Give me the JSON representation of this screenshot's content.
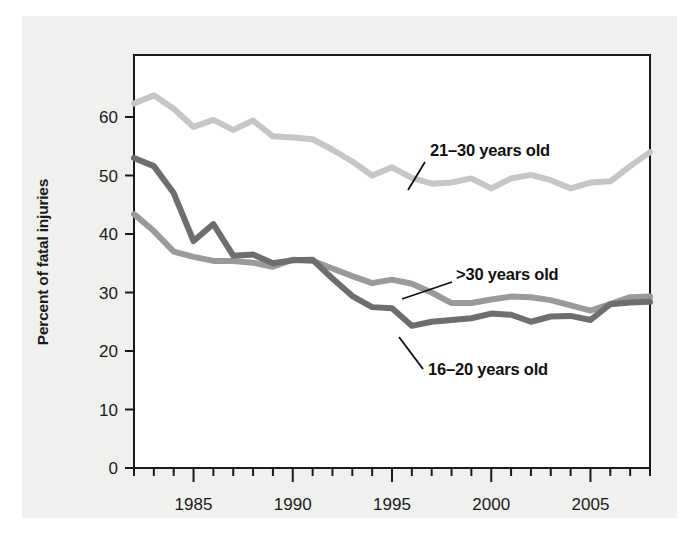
{
  "chart_data": {
    "type": "line",
    "title": "",
    "subtitle": "",
    "xlabel": "",
    "ylabel": "Percent of fatal injuries",
    "xlim": [
      1982,
      2008
    ],
    "ylim": [
      0,
      66
    ],
    "ytick_values": [
      0,
      10,
      20,
      30,
      40,
      50,
      60
    ],
    "ytick_labels": [
      "0",
      "10",
      "20",
      "30",
      "40",
      "50",
      "60"
    ],
    "xtick_labels": [
      "1985",
      "1990",
      "1995",
      "2000",
      "2005"
    ],
    "xtick_major_values": [
      1985,
      1990,
      1995,
      2000,
      2005
    ],
    "xtick_minor_step": 1,
    "grid": false,
    "legend_position": "inline-annotations",
    "x": [
      1982,
      1983,
      1984,
      1985,
      1986,
      1987,
      1988,
      1989,
      1990,
      1991,
      1992,
      1993,
      1994,
      1995,
      1996,
      1997,
      1998,
      1999,
      2000,
      2001,
      2002,
      2003,
      2004,
      2005,
      2006,
      2007,
      2008
    ],
    "series": [
      {
        "name": "21–30 years old",
        "color": "#c6c6c6",
        "values": [
          62.3,
          63.7,
          61.4,
          58.3,
          59.5,
          57.8,
          59.4,
          56.7,
          56.5,
          56.2,
          54.4,
          52.4,
          50.0,
          51.4,
          49.6,
          48.6,
          48.8,
          49.5,
          47.8,
          49.5,
          50.1,
          49.2,
          47.8,
          48.8,
          49.0,
          51.6,
          54.0
        ]
      },
      {
        "name": ">30 years old",
        "color": "#9a9a9a",
        "values": [
          43.4,
          40.5,
          37.0,
          36.1,
          35.4,
          35.4,
          35.1,
          34.4,
          35.6,
          35.4,
          34.1,
          32.8,
          31.6,
          32.2,
          31.5,
          30.0,
          28.2,
          28.2,
          28.8,
          29.3,
          29.2,
          28.7,
          27.8,
          26.9,
          28.0,
          29.2,
          29.3
        ]
      },
      {
        "name": "16–20 years old",
        "color": "#6e6e6e",
        "values": [
          53.0,
          51.6,
          47.0,
          38.8,
          41.7,
          36.3,
          36.5,
          35.0,
          35.5,
          35.6,
          32.4,
          29.4,
          27.5,
          27.3,
          24.3,
          25.0,
          25.3,
          25.6,
          26.4,
          26.2,
          25.0,
          25.9,
          26.0,
          25.3,
          28.0,
          28.3,
          28.4
        ]
      }
    ],
    "annotations": [
      {
        "text": "21–30 years old",
        "series": "21–30 years old",
        "text_x": 430,
        "text_y": 156,
        "leader": {
          "x1": 425,
          "y1": 162,
          "x2": 408,
          "y2": 190
        }
      },
      {
        "text": ">30 years old",
        "series": ">30 years old",
        "text_x": 456,
        "text_y": 280,
        "leader": {
          "x1": 452,
          "y1": 282,
          "x2": 402,
          "y2": 299
        }
      },
      {
        "text": "16–20 years old",
        "series": "16–20 years old",
        "text_x": 428,
        "text_y": 375,
        "leader": {
          "x1": 423,
          "y1": 369,
          "x2": 399,
          "y2": 337
        }
      }
    ]
  },
  "style": {
    "panel_background": "#f0f0ee",
    "plot_background": "#ffffff",
    "axis_color": "#1a1a1a",
    "text_color": "#1a1a1a"
  }
}
